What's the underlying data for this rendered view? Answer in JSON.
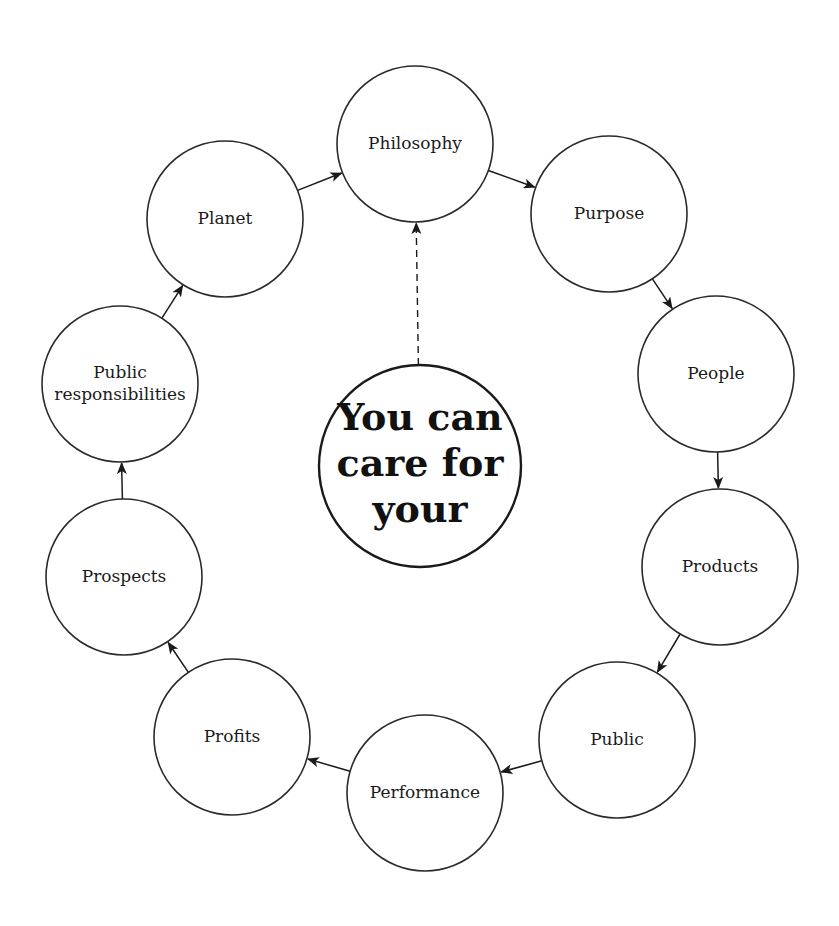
{
  "diagram": {
    "type": "cycle",
    "center": {
      "lines": [
        "You can",
        "care for",
        "your"
      ],
      "cx": 420,
      "cy": 466,
      "r": 101
    },
    "nodes": [
      {
        "id": "philosophy",
        "lines": [
          "Philosophy"
        ],
        "cx": 415,
        "cy": 144,
        "r": 78
      },
      {
        "id": "purpose",
        "lines": [
          "Purpose"
        ],
        "cx": 609,
        "cy": 214,
        "r": 78
      },
      {
        "id": "people",
        "lines": [
          "People"
        ],
        "cx": 716,
        "cy": 374,
        "r": 78
      },
      {
        "id": "products",
        "lines": [
          "Products"
        ],
        "cx": 720,
        "cy": 567,
        "r": 78
      },
      {
        "id": "public",
        "lines": [
          "Public"
        ],
        "cx": 617,
        "cy": 740,
        "r": 78
      },
      {
        "id": "performance",
        "lines": [
          "Performance"
        ],
        "cx": 425,
        "cy": 793,
        "r": 78
      },
      {
        "id": "profits",
        "lines": [
          "Profits"
        ],
        "cx": 232,
        "cy": 737,
        "r": 78
      },
      {
        "id": "prospects",
        "lines": [
          "Prospects"
        ],
        "cx": 124,
        "cy": 577,
        "r": 78
      },
      {
        "id": "public-responsibilities",
        "lines": [
          "Public",
          "responsibilities"
        ],
        "cx": 120,
        "cy": 384,
        "r": 78
      },
      {
        "id": "planet",
        "lines": [
          "Planet"
        ],
        "cx": 225,
        "cy": 219,
        "r": 78
      }
    ],
    "edges": [
      {
        "from": "philosophy",
        "to": "purpose",
        "style": "solid"
      },
      {
        "from": "purpose",
        "to": "people",
        "style": "solid"
      },
      {
        "from": "people",
        "to": "products",
        "style": "solid"
      },
      {
        "from": "products",
        "to": "public",
        "style": "solid"
      },
      {
        "from": "public",
        "to": "performance",
        "style": "solid"
      },
      {
        "from": "performance",
        "to": "profits",
        "style": "solid"
      },
      {
        "from": "profits",
        "to": "prospects",
        "style": "solid"
      },
      {
        "from": "prospects",
        "to": "public-responsibilities",
        "style": "solid"
      },
      {
        "from": "public-responsibilities",
        "to": "planet",
        "style": "solid"
      },
      {
        "from": "planet",
        "to": "philosophy",
        "style": "solid"
      },
      {
        "from": "center",
        "to": "philosophy",
        "style": "dashed"
      }
    ],
    "colors": {
      "stroke": "#2a2a2a",
      "text": "#1a1a1a",
      "background": "#ffffff"
    }
  }
}
